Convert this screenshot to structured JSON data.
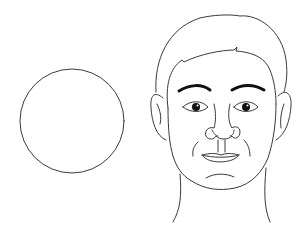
{
  "illustration": {
    "title": "Face shape line drawing",
    "elements": {
      "circle": {
        "label": "round-shape",
        "cx": 72,
        "cy": 121,
        "r": 52
      },
      "face": {
        "label": "male-face-front-view"
      }
    },
    "colors": {
      "background": "#ffffff",
      "line": "#3a3a3a",
      "brow": "#111111"
    }
  }
}
